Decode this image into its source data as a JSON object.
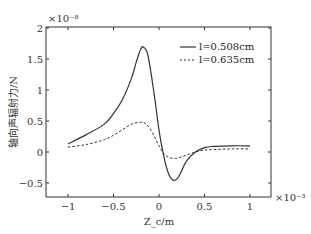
{
  "chart_data": {
    "type": "line",
    "title": "",
    "xlabel": "Z_c/m",
    "ylabel": "轴向声辐射力/N",
    "x_multiplier": "×10⁻³",
    "y_multiplier": "×10⁻⁸",
    "xlim": [
      -1.2,
      1.2
    ],
    "ylim": [
      -0.75,
      2
    ],
    "x_ticks": [
      -1,
      -0.5,
      0,
      0.5,
      1
    ],
    "x_tick_labels": [
      "−1",
      "−0.5",
      "0",
      "0.5",
      "1"
    ],
    "y_ticks": [
      -0.5,
      0,
      0.5,
      1,
      1.5,
      2
    ],
    "y_tick_labels": [
      "−0.5",
      "0",
      "0.5",
      "1",
      "1.5",
      "2"
    ],
    "grid": false,
    "legend_position": "upper right",
    "series": [
      {
        "name": "l=0.508cm",
        "style": "solid",
        "x": [
          -1,
          -0.8,
          -0.6,
          -0.5,
          -0.4,
          -0.3,
          -0.25,
          -0.2,
          -0.17,
          -0.12,
          -0.05,
          0,
          0.05,
          0.1,
          0.15,
          0.2,
          0.25,
          0.3,
          0.4,
          0.5,
          0.6,
          0.8,
          1
        ],
        "values": [
          0.13,
          0.28,
          0.45,
          0.62,
          0.85,
          1.2,
          1.45,
          1.66,
          1.69,
          1.55,
          0.9,
          0.35,
          -0.05,
          -0.33,
          -0.45,
          -0.43,
          -0.3,
          -0.15,
          0.0,
          0.07,
          0.09,
          0.1,
          0.1
        ]
      },
      {
        "name": "l=0.635cm",
        "style": "dashed",
        "x": [
          -1,
          -0.8,
          -0.6,
          -0.5,
          -0.4,
          -0.3,
          -0.2,
          -0.15,
          -0.1,
          -0.05,
          0,
          0.05,
          0.1,
          0.15,
          0.2,
          0.3,
          0.4,
          0.5,
          0.6,
          0.8,
          1
        ],
        "values": [
          0.08,
          0.12,
          0.2,
          0.27,
          0.36,
          0.45,
          0.48,
          0.46,
          0.38,
          0.25,
          0.1,
          -0.02,
          -0.08,
          -0.1,
          -0.1,
          -0.05,
          0.0,
          0.03,
          0.04,
          0.05,
          0.05
        ]
      }
    ]
  }
}
